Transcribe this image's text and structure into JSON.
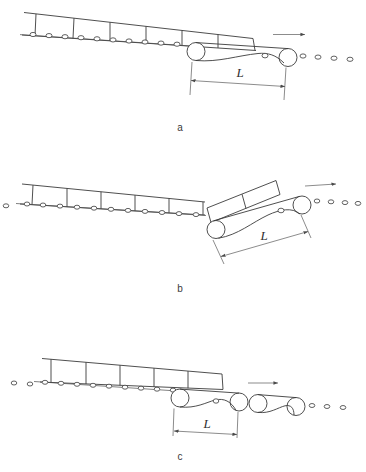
{
  "figure": {
    "background_color": "#ffffff",
    "line_color": "#3b3b3b",
    "panels": [
      {
        "id": "a",
        "caption": "a",
        "dimension_label": "L",
        "description": "Load on roller conveyor passing over a single belt conveyor section of length L, conveyor line straight",
        "belt_sections": 1,
        "load_segments": 6,
        "flow_arrow": "right-arrow-icon",
        "incline": "downward-to-right"
      },
      {
        "id": "b",
        "caption": "b",
        "dimension_label": "L",
        "description": "Load on roller conveyor entering a belt conveyor section of length L inclined upward at a knuckle transition",
        "belt_sections": 1,
        "load_segments": 6,
        "flow_arrow": "right-arrow-icon",
        "incline": "knuckle-upward-transition"
      },
      {
        "id": "c",
        "caption": "c",
        "dimension_label": "L",
        "description": "Load on roller conveyor over two consecutive belt conveyor sections, first of length L",
        "belt_sections": 2,
        "load_segments": 5,
        "flow_arrow": "right-arrow-icon",
        "incline": "downward-to-right"
      }
    ]
  }
}
